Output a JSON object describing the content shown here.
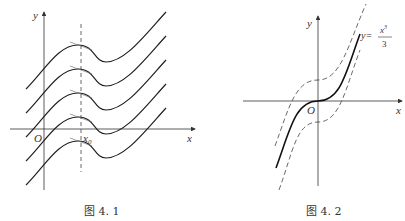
{
  "figure1": {
    "caption": "图 4. 1",
    "axis_x_label": "x",
    "axis_y_label": "y",
    "origin_label": "O",
    "x0_label": "x",
    "x0_sub": "0",
    "curve_count": 5
  },
  "figure2": {
    "caption": "图 4. 2",
    "axis_x_label": "x",
    "axis_y_label": "y",
    "origin_label": "O",
    "curve_label_lhs": "y=",
    "curve_label_num": "x",
    "curve_label_exp": "3",
    "curve_label_den": "3"
  }
}
